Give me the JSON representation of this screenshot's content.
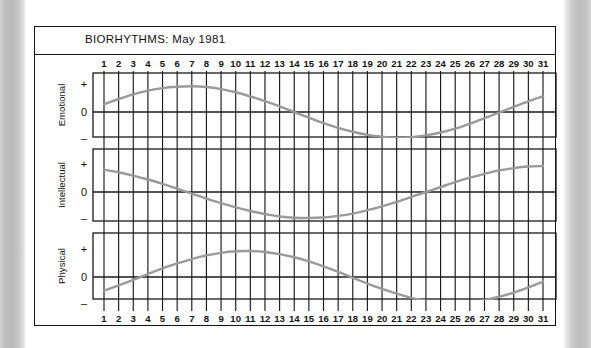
{
  "document": {
    "page_background": "#ffffff",
    "gutter_color": "#bdbdbd"
  },
  "frame": {
    "title": "BIORHYTHMS: May 1981",
    "border_color": "#141414"
  },
  "axis": {
    "sign_plus": "+",
    "sign_zero": "0",
    "sign_minus": "–",
    "day_labels_top": [
      "1",
      "2",
      "3",
      "4",
      "5",
      "6",
      "7",
      "8",
      "9",
      "10",
      "11",
      "12",
      "13",
      "14",
      "15",
      "16",
      "17",
      "18",
      "19",
      "20",
      "21",
      "22",
      "23",
      "24",
      "25",
      "26",
      "27",
      "28",
      "29",
      "30",
      "31"
    ],
    "day_labels_bottom": [
      "1",
      "2",
      "3",
      "4",
      "5",
      "6",
      "7",
      "8",
      "9",
      "10",
      "11",
      "12",
      "13",
      "14",
      "15",
      "16",
      "17",
      "18",
      "19",
      "20",
      "21",
      "22",
      "23",
      "24",
      "25",
      "26",
      "27",
      "28",
      "29",
      "30",
      "31"
    ]
  },
  "panels": [
    {
      "name": "emotional-panel",
      "label": "Emotional"
    },
    {
      "name": "intellectual-panel",
      "label": "Intellectual"
    },
    {
      "name": "physical-panel",
      "label": "Physical"
    }
  ],
  "chart_data": {
    "type": "line",
    "title": "BIORHYTHMS: May 1981",
    "xlabel": "",
    "ylabel": "",
    "grid": true,
    "legend": "none",
    "x": [
      1,
      2,
      3,
      4,
      5,
      6,
      7,
      8,
      9,
      10,
      11,
      12,
      13,
      14,
      15,
      16,
      17,
      18,
      19,
      20,
      21,
      22,
      23,
      24,
      25,
      26,
      27,
      28,
      29,
      30,
      31
    ],
    "xlim": [
      1,
      31
    ],
    "ylim": [
      -1,
      1
    ],
    "yticks": [
      1,
      0,
      -1
    ],
    "ytick_labels": [
      "+",
      "0",
      "–"
    ],
    "curve_color": "#9a9a9a",
    "gridline_color": "#1a1a1a",
    "series": [
      {
        "name": "Emotional",
        "cycle_days": 28,
        "phase_start_day": 1,
        "values": [
          0.3,
          0.5,
          0.68,
          0.82,
          0.92,
          0.97,
          0.99,
          0.96,
          0.88,
          0.76,
          0.6,
          0.42,
          0.22,
          0.0,
          -0.22,
          -0.43,
          -0.61,
          -0.76,
          -0.88,
          -0.95,
          -0.99,
          -0.97,
          -0.9,
          -0.79,
          -0.64,
          -0.45,
          -0.24,
          -0.02,
          0.2,
          0.41,
          0.6
        ]
      },
      {
        "name": "Intellectual",
        "cycle_days": 33,
        "phase_start_day": 1,
        "values": [
          0.86,
          0.76,
          0.63,
          0.48,
          0.31,
          0.13,
          -0.06,
          -0.25,
          -0.43,
          -0.59,
          -0.73,
          -0.85,
          -0.94,
          -0.99,
          -1.0,
          -0.98,
          -0.92,
          -0.83,
          -0.7,
          -0.55,
          -0.38,
          -0.19,
          0.0,
          0.19,
          0.38,
          0.55,
          0.7,
          0.83,
          0.92,
          0.98,
          1.0
        ]
      },
      {
        "name": "Physical",
        "cycle_days": 23,
        "phase_start_day": 1,
        "values": [
          -0.52,
          -0.32,
          -0.11,
          0.11,
          0.33,
          0.52,
          0.69,
          0.83,
          0.93,
          0.99,
          1.0,
          0.96,
          0.88,
          0.76,
          0.6,
          0.41,
          0.2,
          -0.03,
          -0.25,
          -0.46,
          -0.64,
          -0.8,
          -0.91,
          -0.98,
          -1.0,
          -0.97,
          -0.89,
          -0.76,
          -0.6,
          -0.4,
          -0.18
        ]
      }
    ]
  }
}
